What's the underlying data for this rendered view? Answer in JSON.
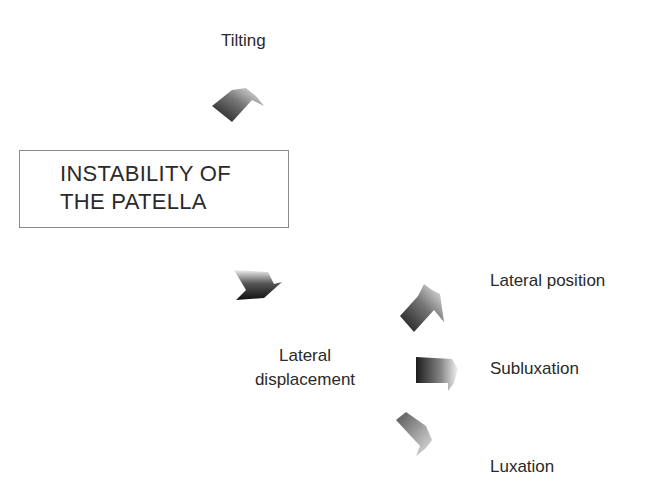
{
  "diagram": {
    "main_box": {
      "line1": "INSTABILITY OF",
      "line2": "THE PATELLA"
    },
    "branches": {
      "tilting": "Tilting",
      "lateral_displacement_line1": "Lateral",
      "lateral_displacement_line2": "displacement"
    },
    "sub_branches": {
      "lateral_position": "Lateral position",
      "subluxation": "Subluxation",
      "luxation": "Luxation"
    },
    "arrow_gradient": {
      "dark": "#1a1a1a",
      "light": "#f2f2f2"
    }
  }
}
